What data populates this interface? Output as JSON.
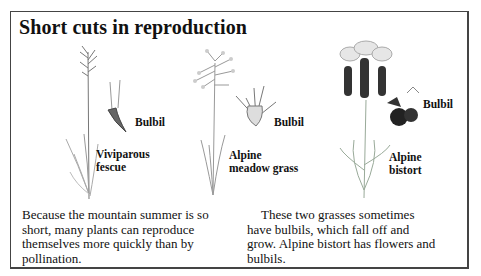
{
  "title": "Short cuts in reproduction",
  "plants": [
    {
      "name_line1": "Viviparous",
      "name_line2": "fescue",
      "bulbil_label": "Bulbil"
    },
    {
      "name_line1": "Alpine",
      "name_line2": "meadow grass",
      "bulbil_label": "Bulbil"
    },
    {
      "name_line1": "Alpine",
      "name_line2": "bistort",
      "bulbil_label": "Bulbil"
    }
  ],
  "paragraphs": {
    "left": [
      "Because the mountain summer is so",
      "short, many plants can reproduce",
      "themselves more quickly than by",
      "pollination."
    ],
    "right": [
      "These two grasses sometimes",
      "have bulbils, which fall off and",
      "grow. Alpine bistort has flowers and",
      "bulbils."
    ]
  },
  "illustrations": {
    "fescue": "viviparous-fescue-illustration",
    "meadow_grass": "alpine-meadow-grass-illustration",
    "bistort": "alpine-bistort-illustration"
  }
}
